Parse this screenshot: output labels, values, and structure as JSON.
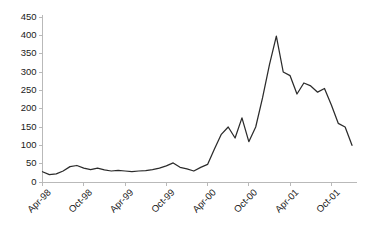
{
  "chart_data": {
    "type": "line",
    "title": "",
    "subtitle": "",
    "xlabel": "",
    "ylabel": "",
    "ylim": [
      0,
      450
    ],
    "ytick_values": [
      0,
      50,
      100,
      150,
      200,
      250,
      300,
      350,
      400,
      450
    ],
    "ytick_labels": [
      "0",
      "50",
      "100",
      "150",
      "200",
      "250",
      "300",
      "350",
      "400",
      "450"
    ],
    "grid": false,
    "legend": "none",
    "x_tick_labels": [
      "Apr-98",
      "Oct-98",
      "Apr-99",
      "Oct-99",
      "Apr-00",
      "Oct-00",
      "Apr-01",
      "Oct-01"
    ],
    "x_tick_indices": [
      0,
      6,
      12,
      18,
      24,
      30,
      36,
      42
    ],
    "x_tick_rotation": -45,
    "line_color": "#2b2b2b",
    "axis_color": "#b9b9b9",
    "background_color": "#ffffff",
    "x": [
      "Apr-98",
      "May-98",
      "Jun-98",
      "Jul-98",
      "Aug-98",
      "Sep-98",
      "Oct-98",
      "Nov-98",
      "Dec-98",
      "Jan-99",
      "Feb-99",
      "Mar-99",
      "Apr-99",
      "May-99",
      "Jun-99",
      "Jul-99",
      "Aug-99",
      "Sep-99",
      "Oct-99",
      "Nov-99",
      "Dec-99",
      "Jan-00",
      "Feb-00",
      "Mar-00",
      "Apr-00",
      "May-00",
      "Jun-00",
      "Jul-00",
      "Aug-00",
      "Sep-00",
      "Oct-00",
      "Nov-00",
      "Dec-00",
      "Jan-01",
      "Feb-01",
      "Mar-01",
      "Apr-01",
      "May-01",
      "Jun-01",
      "Jul-01",
      "Aug-01",
      "Sep-01",
      "Oct-01",
      "Nov-01",
      "Dec-01",
      "Jan-02"
    ],
    "values": [
      28,
      20,
      22,
      30,
      42,
      45,
      38,
      34,
      38,
      33,
      30,
      32,
      30,
      28,
      30,
      31,
      34,
      38,
      44,
      52,
      40,
      36,
      30,
      40,
      48,
      90,
      130,
      150,
      120,
      175,
      110,
      150,
      230,
      320,
      398,
      300,
      290,
      240,
      270,
      262,
      245,
      255,
      210,
      160,
      150,
      100
    ],
    "series_name": "value",
    "notes": {
      "peak_label": "398",
      "peak_x": "Feb-01",
      "start_value": "28",
      "end_value": "75"
    }
  },
  "accessibility": {
    "chart_description": "Line chart of a value rising from about 30 in Apr-98, staying low through Apr-00, then spiking to a peak near 400 around early 2001 before declining to about 75 by late 2001."
  }
}
